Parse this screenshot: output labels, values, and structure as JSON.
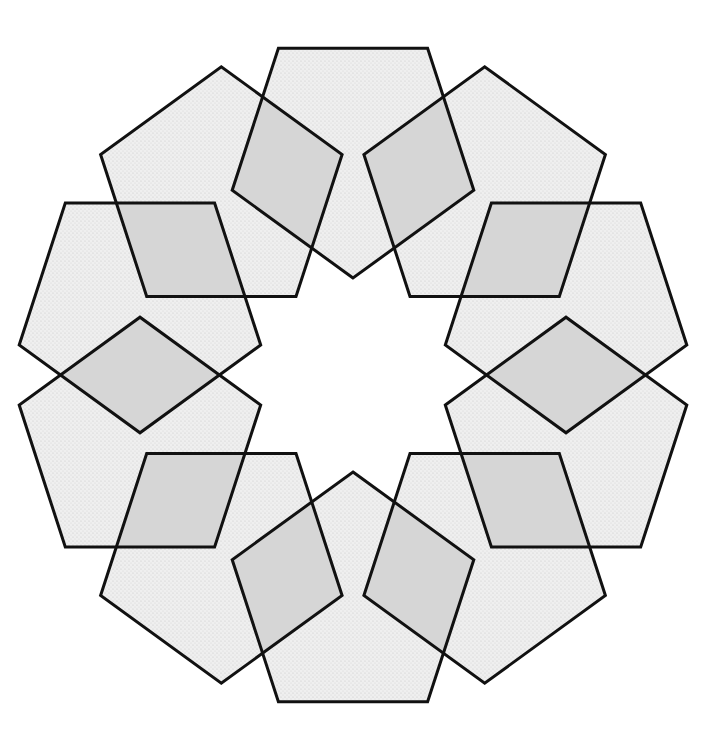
{
  "figure": {
    "title": "",
    "center": [
      353,
      375
    ],
    "ring_radius": 224,
    "pentagon_circumradius": 127,
    "pentagon_count": 10,
    "start_angle_deg": -90,
    "step_angle_deg": 36,
    "colors": {
      "background": "#ffffff",
      "pentagon_fill": "#ececec",
      "overlap_fill": "#d6d6d6",
      "stroke": "#111111"
    },
    "stroke_width": 3
  }
}
